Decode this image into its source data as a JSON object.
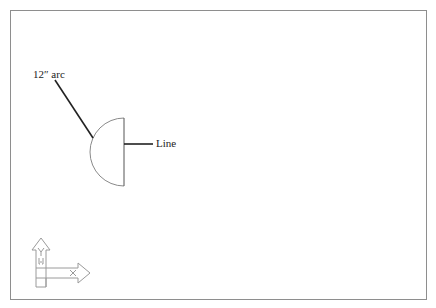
{
  "drawing": {
    "title": "",
    "annotations": {
      "arc_label": "12″ arc",
      "line_label": "Line"
    },
    "ucs_icon": {
      "y_axis_label": "Y",
      "x_axis_label": "X",
      "origin_marker": "[-]"
    },
    "colors": {
      "frame": "#8e8e8e",
      "geometry": "#555555",
      "leader": "#222222",
      "ucs": "#9a9a9a",
      "background": "#ffffff"
    }
  }
}
